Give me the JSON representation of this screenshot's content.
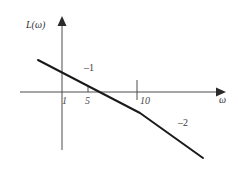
{
  "figure": {
    "name": "asymptotic-log-magnitude-bode-plot",
    "background_color": "#ffffff",
    "line_color": "#1a1a1a",
    "axis_color": "#4d4d4d",
    "text_color": "#333333"
  },
  "axes": {
    "y_axis_label": "L(ω)",
    "x_axis_label": "ω",
    "x_tick_labels": [
      "1",
      "5",
      "10"
    ],
    "y_tick_labels": []
  },
  "annotations": {
    "slope_first": "–1",
    "slope_second": "–2"
  },
  "chart_data": {
    "type": "line",
    "title": "",
    "xlabel": "ω",
    "ylabel": "L(ω)",
    "x_scale": "logarithmic",
    "grid": false,
    "legend": null,
    "x_tick_values": [
      1,
      5,
      10
    ],
    "x_tick_labels": [
      "1",
      "5",
      "10"
    ],
    "y_tick_values": [],
    "y_tick_labels": [],
    "zero_line": true,
    "series": [
      {
        "name": "L(ω) asymptote",
        "points": [
          {
            "px": 38,
            "py": 60
          },
          {
            "px": 140,
            "py": 113
          },
          {
            "px": 203,
            "py": 158
          }
        ],
        "segments": [
          {
            "slope_label": "–1",
            "from_x_tick": "1",
            "to_x_tick": "10"
          },
          {
            "slope_label": "–2",
            "from_x_tick": "10",
            "to_x_tick": "end"
          }
        ],
        "crosses_zero_near": "5"
      }
    ],
    "annotations": [
      {
        "text": "–1",
        "px": 84,
        "py": 63
      },
      {
        "text": "–2",
        "px": 178,
        "py": 118
      }
    ]
  }
}
